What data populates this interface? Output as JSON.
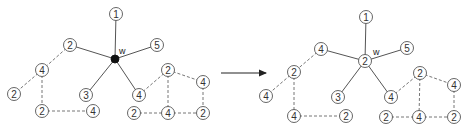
{
  "figure": {
    "node_radius": 6.5,
    "arrow": {
      "x1": 221,
      "y1": 73,
      "x2": 266,
      "y2": 73,
      "color": "#222222"
    },
    "graphs": [
      {
        "id": "before",
        "center_label": "w",
        "center_label_pos": [
          119,
          54
        ],
        "center": {
          "x": 115,
          "y": 59,
          "filled": true,
          "label": ""
        },
        "nodes": [
          {
            "id": "n1",
            "label": "1",
            "x": 116,
            "y": 14
          },
          {
            "id": "n5",
            "label": "5",
            "x": 157,
            "y": 45
          },
          {
            "id": "nA2",
            "label": "2",
            "x": 70,
            "y": 45
          },
          {
            "id": "nA4",
            "label": "4",
            "x": 42,
            "y": 70
          },
          {
            "id": "nA2b",
            "label": "2",
            "x": 14,
            "y": 94
          },
          {
            "id": "n3",
            "label": "3",
            "x": 86,
            "y": 95
          },
          {
            "id": "nB4",
            "label": "4",
            "x": 139,
            "y": 95
          },
          {
            "id": "nA2c",
            "label": "2",
            "x": 42,
            "y": 111
          },
          {
            "id": "nA4b",
            "label": "4",
            "x": 93,
            "y": 111
          },
          {
            "id": "nC2",
            "label": "2",
            "x": 168,
            "y": 70
          },
          {
            "id": "nC4",
            "label": "4",
            "x": 203,
            "y": 82
          },
          {
            "id": "nC2b",
            "label": "2",
            "x": 134,
            "y": 113
          },
          {
            "id": "nC4b",
            "label": "4",
            "x": 168,
            "y": 113
          },
          {
            "id": "nC2c",
            "label": "2",
            "x": 203,
            "y": 113
          }
        ],
        "solid_edges": [
          [
            "center",
            "n1"
          ],
          [
            "center",
            "n5"
          ],
          [
            "center",
            "nA2"
          ],
          [
            "center",
            "n3"
          ],
          [
            "center",
            "nB4"
          ]
        ],
        "dashed_edges": [
          [
            "nA2",
            "nA4"
          ],
          [
            "nA4",
            "nA2b"
          ],
          [
            "nA4",
            "nA2c"
          ],
          [
            "nA2c",
            "nA4b"
          ],
          [
            "nB4",
            "nC2"
          ],
          [
            "nC2",
            "nC4"
          ],
          [
            "nC2",
            "nC4b"
          ],
          [
            "nC4",
            "nC2c"
          ],
          [
            "nC2b",
            "nC4b"
          ],
          [
            "nC4b",
            "nC2c"
          ]
        ]
      },
      {
        "id": "after",
        "center_label": "w",
        "center_label_pos": [
          373,
          55
        ],
        "center": {
          "x": 365,
          "y": 61,
          "filled": false,
          "label": "2"
        },
        "nodes": [
          {
            "id": "n1",
            "label": "1",
            "x": 366,
            "y": 17
          },
          {
            "id": "n5",
            "label": "5",
            "x": 407,
            "y": 48
          },
          {
            "id": "nA2",
            "label": "4",
            "x": 321,
            "y": 49
          },
          {
            "id": "nA4",
            "label": "2",
            "x": 294,
            "y": 72
          },
          {
            "id": "nA2b",
            "label": "4",
            "x": 266,
            "y": 96
          },
          {
            "id": "n3",
            "label": "3",
            "x": 338,
            "y": 97
          },
          {
            "id": "nB4",
            "label": "4",
            "x": 391,
            "y": 97
          },
          {
            "id": "nA2c",
            "label": "4",
            "x": 294,
            "y": 116
          },
          {
            "id": "nA4b",
            "label": "2",
            "x": 346,
            "y": 116
          },
          {
            "id": "nC2",
            "label": "2",
            "x": 420,
            "y": 73
          },
          {
            "id": "nC4",
            "label": "4",
            "x": 454,
            "y": 85
          },
          {
            "id": "nC2b",
            "label": "2",
            "x": 386,
            "y": 117
          },
          {
            "id": "nC4b",
            "label": "4",
            "x": 419,
            "y": 117
          },
          {
            "id": "nC2c",
            "label": "2",
            "x": 454,
            "y": 117
          }
        ],
        "solid_edges": [
          [
            "center",
            "n1"
          ],
          [
            "center",
            "n5"
          ],
          [
            "center",
            "nA2"
          ],
          [
            "center",
            "n3"
          ],
          [
            "center",
            "nB4"
          ]
        ],
        "dashed_edges": [
          [
            "nA2",
            "nA4"
          ],
          [
            "nA4",
            "nA2b"
          ],
          [
            "nA4",
            "nA2c"
          ],
          [
            "nA2c",
            "nA4b"
          ],
          [
            "nB4",
            "nC2"
          ],
          [
            "nC2",
            "nC4"
          ],
          [
            "nC2",
            "nC4b"
          ],
          [
            "nC4",
            "nC2c"
          ],
          [
            "nC2b",
            "nC4b"
          ],
          [
            "nC4b",
            "nC2c"
          ]
        ]
      }
    ]
  }
}
